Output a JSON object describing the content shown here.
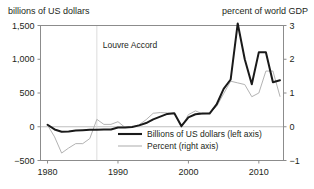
{
  "titles": {
    "left_axis_title": "billions of US dollars",
    "right_axis_title": "percent of world GDP"
  },
  "annotation": {
    "label": "Louvre Accord",
    "year": 1987
  },
  "legend": {
    "items": [
      {
        "label": "Billions of US dollars (left axis)",
        "color": "#1a1a1a",
        "width": 2.1
      },
      {
        "label": "Percent (right axis)",
        "color": "#b3b3b3",
        "width": 1.1
      }
    ]
  },
  "colors": {
    "dollars_line": "#1a1a1a",
    "percent_line": "#b3b3b3",
    "frame": "#8c8c8c",
    "zero_line": "#bfbfbf",
    "text": "#231f20"
  },
  "chart_data": {
    "type": "line",
    "title": "",
    "subtitle": "",
    "xlabel": "",
    "ylabel": "billions of US dollars",
    "y2label": "percent of world GDP",
    "grid": false,
    "legend_position": "inside-bottom-center",
    "xlim": [
      1979,
      1913.5
    ],
    "xlim_actual": [
      1979,
      2013.5
    ],
    "xticks": [
      1980,
      1990,
      2000,
      2010
    ],
    "xticklabels": [
      "1980",
      "1990",
      "2000",
      "2010"
    ],
    "ylim": [
      -500,
      1500
    ],
    "yticks": [
      -500,
      0,
      500,
      1000,
      1500
    ],
    "yticklabels": [
      "−500",
      "0",
      "500",
      "1,000",
      "1,500"
    ],
    "y2lim": [
      -1,
      3
    ],
    "y2ticks": [
      -1,
      0,
      1,
      2,
      3
    ],
    "y2ticklabels": [
      "−1",
      "0",
      "1",
      "2",
      "3"
    ],
    "annotations": [
      {
        "text": "Louvre Accord",
        "x": 1987,
        "type": "vline-label"
      }
    ],
    "x": [
      1980,
      1981,
      1982,
      1983,
      1984,
      1985,
      1986,
      1987,
      1988,
      1989,
      1990,
      1991,
      1992,
      1993,
      1994,
      1995,
      1996,
      1997,
      1998,
      1999,
      2000,
      2001,
      2002,
      2003,
      2004,
      2005,
      2006,
      2007,
      2008,
      2009,
      2010,
      2011,
      2012,
      2013
    ],
    "series": [
      {
        "name": "Billions of US dollars (left axis)",
        "axis": "left",
        "color": "#1a1a1a",
        "values": [
          30,
          -40,
          -75,
          -70,
          -55,
          -50,
          -45,
          -45,
          -40,
          -40,
          -10,
          -10,
          -5,
          20,
          55,
          110,
          150,
          190,
          200,
          10,
          140,
          185,
          195,
          195,
          330,
          560,
          700,
          1530,
          1000,
          630,
          1105,
          1105,
          660,
          690
        ]
      },
      {
        "name": "Percent (right axis)",
        "axis": "right",
        "color": "#b3b3b3",
        "values": [
          0.05,
          -0.3,
          -0.78,
          -0.63,
          -0.5,
          -0.5,
          -0.35,
          0.22,
          0.07,
          0.07,
          0.15,
          -0.02,
          -0.01,
          0.06,
          0.21,
          0.4,
          0.42,
          0.41,
          0.4,
          -0.02,
          0.36,
          0.47,
          0.38,
          0.4,
          0.6,
          0.98,
          1.35,
          1.3,
          1.25,
          0.89,
          1.0,
          1.65,
          1.65,
          0.9
        ]
      }
    ]
  }
}
